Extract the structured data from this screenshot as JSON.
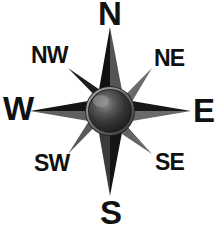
{
  "figure": {
    "background_color": "#ffffff",
    "label_color": "#111111"
  },
  "compass": {
    "center_x": 110,
    "center_y": 111,
    "hub": {
      "name": "compass-center-sphere",
      "radius": 22,
      "fill_dark": "#2e2e2e",
      "fill_light": "#8a8a8a",
      "ring_color": "#9a9a9a"
    },
    "points": [
      {
        "id": "n",
        "label": "N",
        "bearing_deg": 0,
        "kind": "cardinal",
        "length": 84
      },
      {
        "id": "ne",
        "label": "NE",
        "bearing_deg": 45,
        "kind": "intercardinal",
        "length": 55
      },
      {
        "id": "e",
        "label": "E",
        "bearing_deg": 90,
        "kind": "cardinal",
        "length": 80
      },
      {
        "id": "se",
        "label": "SE",
        "bearing_deg": 135,
        "kind": "intercardinal",
        "length": 55
      },
      {
        "id": "s",
        "label": "S",
        "bearing_deg": 180,
        "kind": "cardinal",
        "length": 84
      },
      {
        "id": "sw",
        "label": "SW",
        "bearing_deg": 225,
        "kind": "intercardinal",
        "length": 55
      },
      {
        "id": "w",
        "label": "W",
        "bearing_deg": 270,
        "kind": "cardinal",
        "length": 80
      },
      {
        "id": "nw",
        "label": "NW",
        "bearing_deg": 315,
        "kind": "intercardinal",
        "length": 55
      }
    ],
    "colors": {
      "point_dark": "#1c1c1c",
      "point_light": "#6f6f6f",
      "point_mid": "#444444"
    }
  },
  "labels": {
    "n": "N",
    "ne": "NE",
    "e": "E",
    "se": "SE",
    "s": "S",
    "sw": "SW",
    "w": "W",
    "nw": "NW"
  }
}
